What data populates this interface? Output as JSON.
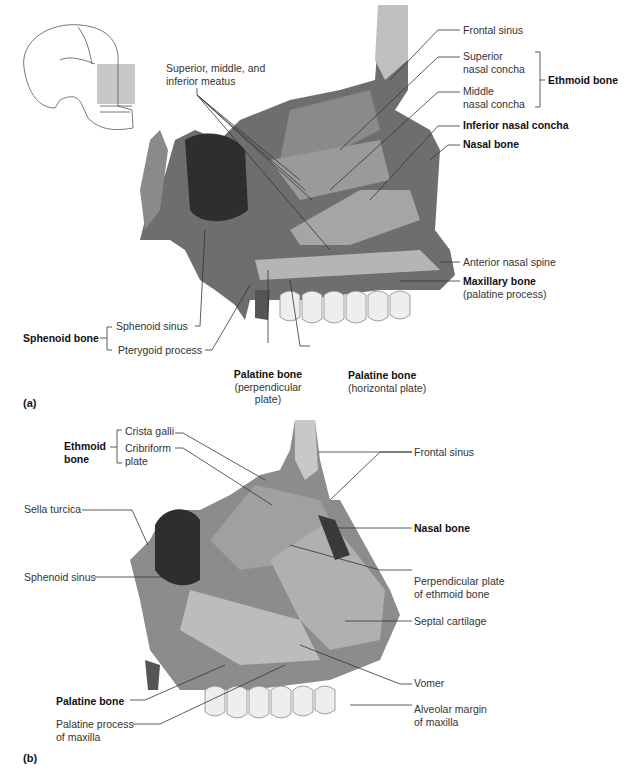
{
  "figure": {
    "panel_a": {
      "letter": "(a)",
      "locator_icon": "skull-locator",
      "labels": {
        "meatus_l1": "Superior, middle, and",
        "meatus_l2": "inferior meatus",
        "frontal_sinus": "Frontal sinus",
        "superior_concha_l1": "Superior",
        "superior_concha_l2": "nasal concha",
        "middle_concha_l1": "Middle",
        "middle_concha_l2": "nasal concha",
        "ethmoid_bone": "Ethmoid bone",
        "inferior_concha": "Inferior nasal concha",
        "nasal_bone": "Nasal bone",
        "anterior_nasal_spine": "Anterior nasal spine",
        "maxillary_bone": "Maxillary bone",
        "maxillary_sub": "(palatine process)",
        "sphenoid_bone": "Sphenoid bone",
        "sphenoid_sinus": "Sphenoid sinus",
        "pterygoid_process": "Pterygoid process",
        "palatine_perp": "Palatine bone",
        "palatine_perp_sub1": "(perpendicular",
        "palatine_perp_sub2": "plate)",
        "palatine_horiz": "Palatine bone",
        "palatine_horiz_sub": "(horizontal plate)"
      }
    },
    "panel_b": {
      "letter": "(b)",
      "labels": {
        "ethmoid_l1": "Ethmoid",
        "ethmoid_l2": "bone",
        "crista_galli": "Crista galli",
        "cribriform_l1": "Cribriform",
        "cribriform_l2": "plate",
        "sella_turcica": "Sella turcica",
        "sphenoid_sinus": "Sphenoid sinus",
        "frontal_sinus": "Frontal sinus",
        "nasal_bone": "Nasal bone",
        "perp_plate_l1": "Perpendicular plate",
        "perp_plate_l2": "of ethmoid bone",
        "septal_cartilage": "Septal cartilage",
        "vomer": "Vomer",
        "alveolar_l1": "Alveolar margin",
        "alveolar_l2": "of maxilla",
        "palatine_bone": "Palatine bone",
        "palatine_process_l1": "Palatine process",
        "palatine_process_l2": "of maxilla"
      }
    },
    "colors": {
      "bone_dark": "#3a3a3a",
      "bone_mid": "#6e6e6e",
      "bone_light": "#9c9c9c",
      "spongy": "#b5b5b5",
      "teeth": "#f2f2f2",
      "locator_box": "#c8c8c8"
    }
  }
}
